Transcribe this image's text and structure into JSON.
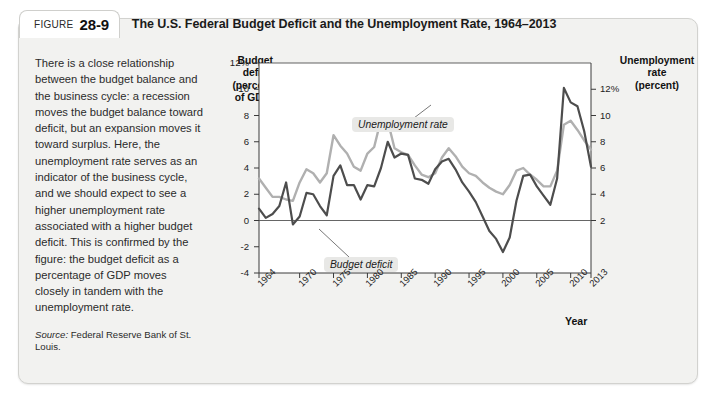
{
  "figure": {
    "label_word": "Figure",
    "number": "28-9",
    "title": "The U.S. Federal Budget Deficit and the Unemployment Rate, 1964–2013"
  },
  "side_text": {
    "body": "There is a close relationship between the budget balance and the business cycle: a recession moves the budget balance toward deficit, but an expansion moves it toward surplus. Here, the unemployment rate serves as an indicator of the business cycle, and we should expect to see a higher unemployment rate associated with a higher budget deficit. This is confirmed by the figure: the budget deficit as a percentage of GDP moves closely in tandem with the unemployment rate.",
    "source_prefix": "Source:",
    "source_text": " Federal Reserve Bank of St. Louis."
  },
  "colors": {
    "deficit_line": "#4d4d4d",
    "unemployment_line": "#b0b0b0",
    "plot_background": "#ffffff",
    "card_background": "#f2f2f0",
    "axis": "#3a3a3a"
  },
  "chart_data": {
    "type": "line",
    "title": "The U.S. Federal Budget Deficit and the Unemployment Rate, 1964–2013",
    "xlabel": "Year",
    "ylabel": "Budget deficit (percent of GDP)",
    "y2label": "Unemployment rate (percent)",
    "grid": false,
    "legend": "inline-annotations",
    "xlim": [
      1964,
      2013
    ],
    "xticks": [
      1964,
      1970,
      1975,
      1980,
      1985,
      1990,
      1995,
      2000,
      2005,
      2010,
      2013
    ],
    "xtick_labels": [
      "1964",
      "1970",
      "1975",
      "1980",
      "1985",
      "1990",
      "1995",
      "2000",
      "2005",
      "2010",
      "2013"
    ],
    "ylim": [
      -4,
      12
    ],
    "yticks": [
      12,
      10,
      8,
      6,
      4,
      2,
      0,
      -2,
      -4
    ],
    "ytick_labels": [
      "12%",
      "10",
      "8",
      "6",
      "4",
      "2",
      "0",
      "-2",
      "-4"
    ],
    "y2lim": [
      -2,
      14
    ],
    "y2ticks": [
      12,
      10,
      8,
      6,
      4,
      2
    ],
    "y2tick_labels": [
      "12%",
      "10",
      "8",
      "6",
      "4",
      "2"
    ],
    "zero_line": 0,
    "x": [
      1964,
      1965,
      1966,
      1967,
      1968,
      1969,
      1970,
      1971,
      1972,
      1973,
      1974,
      1975,
      1976,
      1977,
      1978,
      1979,
      1980,
      1981,
      1982,
      1983,
      1984,
      1985,
      1986,
      1987,
      1988,
      1989,
      1990,
      1991,
      1992,
      1993,
      1994,
      1995,
      1996,
      1997,
      1998,
      1999,
      2000,
      2001,
      2002,
      2003,
      2004,
      2005,
      2006,
      2007,
      2008,
      2009,
      2010,
      2011,
      2012,
      2013
    ],
    "series": [
      {
        "name": "Budget deficit",
        "axis": "left",
        "color": "#4d4d4d",
        "label_text": "Budget deficit",
        "values": [
          0.9,
          0.2,
          0.5,
          1.1,
          2.9,
          -0.3,
          0.3,
          2.1,
          2.0,
          1.1,
          0.4,
          3.4,
          4.2,
          2.7,
          2.7,
          1.6,
          2.7,
          2.6,
          4.0,
          6.0,
          4.8,
          5.1,
          5.0,
          3.2,
          3.1,
          2.8,
          3.9,
          4.5,
          4.7,
          3.9,
          2.9,
          2.2,
          1.4,
          0.3,
          -0.8,
          -1.4,
          -2.4,
          -1.3,
          1.5,
          3.4,
          3.5,
          2.6,
          1.9,
          1.2,
          3.2,
          10.1,
          9.0,
          8.7,
          6.8,
          4.1
        ]
      },
      {
        "name": "Unemployment rate",
        "axis": "right",
        "color": "#b0b0b0",
        "label_text": "Unemployment rate",
        "values": [
          5.2,
          4.5,
          3.8,
          3.8,
          3.6,
          3.5,
          4.9,
          5.9,
          5.6,
          4.9,
          5.6,
          8.5,
          7.7,
          7.1,
          6.1,
          5.8,
          7.1,
          7.6,
          9.7,
          9.6,
          7.5,
          7.2,
          7.0,
          6.2,
          5.5,
          5.3,
          5.6,
          6.8,
          7.5,
          6.9,
          6.1,
          5.6,
          5.4,
          4.9,
          4.5,
          4.2,
          4.0,
          4.7,
          5.8,
          6.0,
          5.5,
          5.1,
          4.6,
          4.6,
          5.8,
          9.3,
          9.6,
          8.9,
          8.1,
          7.4
        ]
      }
    ]
  }
}
